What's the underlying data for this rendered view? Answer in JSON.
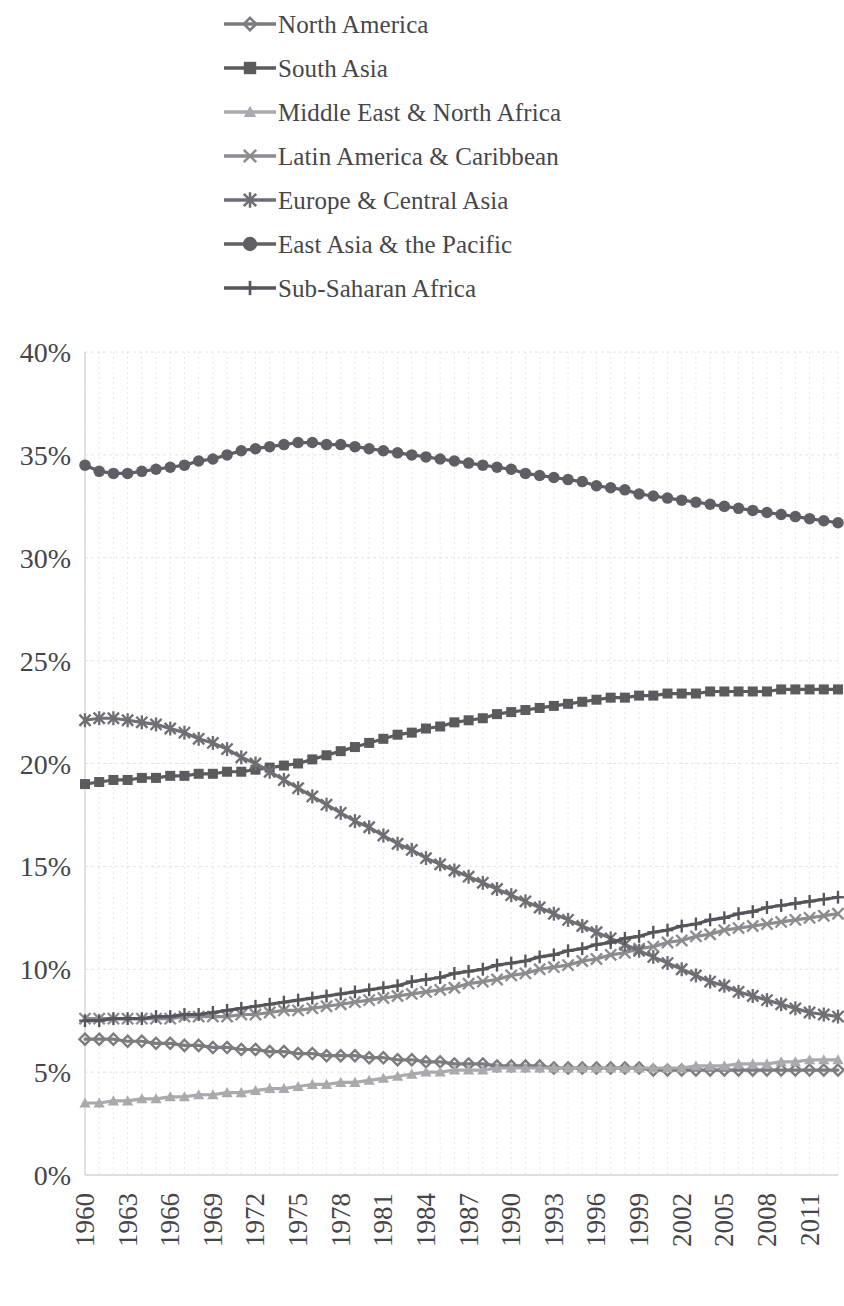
{
  "legend": {
    "position": "top",
    "items": [
      {
        "label": "North America",
        "marker": "diamond",
        "color": "#7b7b80"
      },
      {
        "label": "South Asia",
        "marker": "square",
        "color": "#5a5a5f"
      },
      {
        "label": "Middle East & North Africa",
        "marker": "triangle",
        "color": "#a9a9ae"
      },
      {
        "label": "Latin America & Caribbean",
        "marker": "x",
        "color": "#8b8b90"
      },
      {
        "label": "Europe & Central Asia",
        "marker": "asterisk",
        "color": "#6e6e74"
      },
      {
        "label": "East Asia & the Pacific",
        "marker": "circle",
        "color": "#5e5e64"
      },
      {
        "label": "Sub-Saharan Africa",
        "marker": "plus",
        "color": "#55555b"
      }
    ]
  },
  "axes": {
    "y_ticks": [
      "0%",
      "5%",
      "10%",
      "15%",
      "20%",
      "25%",
      "30%",
      "35%",
      "40%"
    ],
    "x_ticks": [
      "1960",
      "1963",
      "1966",
      "1969",
      "1972",
      "1975",
      "1978",
      "1981",
      "1984",
      "1987",
      "1990",
      "1993",
      "1996",
      "1999",
      "2002",
      "2005",
      "2008",
      "2011"
    ],
    "grid": "both-faint"
  },
  "chart_data": {
    "type": "line",
    "title": "",
    "subtitle": "",
    "xlabel": "",
    "ylabel": "",
    "ylim": [
      0,
      40
    ],
    "yunit": "%",
    "ytick_step": 5,
    "xlim": [
      1960,
      2013
    ],
    "xtick_step": 3,
    "grid": true,
    "legend_position": "top",
    "x": [
      1960,
      1961,
      1962,
      1963,
      1964,
      1965,
      1966,
      1967,
      1968,
      1969,
      1970,
      1971,
      1972,
      1973,
      1974,
      1975,
      1976,
      1977,
      1978,
      1979,
      1980,
      1981,
      1982,
      1983,
      1984,
      1985,
      1986,
      1987,
      1988,
      1989,
      1990,
      1991,
      1992,
      1993,
      1994,
      1995,
      1996,
      1997,
      1998,
      1999,
      2000,
      2001,
      2002,
      2003,
      2004,
      2005,
      2006,
      2007,
      2008,
      2009,
      2010,
      2011,
      2012,
      2013
    ],
    "series": [
      {
        "name": "North America",
        "marker": "diamond",
        "color": "#7b7b80",
        "values": [
          6.6,
          6.6,
          6.6,
          6.5,
          6.5,
          6.4,
          6.4,
          6.3,
          6.3,
          6.2,
          6.2,
          6.1,
          6.1,
          6.0,
          6.0,
          5.9,
          5.9,
          5.8,
          5.8,
          5.8,
          5.7,
          5.7,
          5.6,
          5.6,
          5.5,
          5.5,
          5.4,
          5.4,
          5.4,
          5.3,
          5.3,
          5.3,
          5.3,
          5.2,
          5.2,
          5.2,
          5.2,
          5.2,
          5.2,
          5.2,
          5.1,
          5.1,
          5.1,
          5.1,
          5.1,
          5.1,
          5.1,
          5.1,
          5.1,
          5.1,
          5.1,
          5.1,
          5.1,
          5.1
        ]
      },
      {
        "name": "South Asia",
        "marker": "square",
        "color": "#5a5a5f",
        "values": [
          19.0,
          19.1,
          19.2,
          19.2,
          19.3,
          19.3,
          19.4,
          19.4,
          19.5,
          19.5,
          19.6,
          19.6,
          19.7,
          19.8,
          19.9,
          20.0,
          20.2,
          20.4,
          20.6,
          20.8,
          21.0,
          21.2,
          21.4,
          21.5,
          21.7,
          21.8,
          22.0,
          22.1,
          22.2,
          22.4,
          22.5,
          22.6,
          22.7,
          22.8,
          22.9,
          23.0,
          23.1,
          23.2,
          23.2,
          23.3,
          23.3,
          23.4,
          23.4,
          23.4,
          23.5,
          23.5,
          23.5,
          23.5,
          23.5,
          23.6,
          23.6,
          23.6,
          23.6,
          23.6
        ]
      },
      {
        "name": "Middle East & North Africa",
        "marker": "triangle",
        "color": "#a9a9ae",
        "values": [
          3.5,
          3.5,
          3.6,
          3.6,
          3.7,
          3.7,
          3.8,
          3.8,
          3.9,
          3.9,
          4.0,
          4.0,
          4.1,
          4.2,
          4.2,
          4.3,
          4.4,
          4.4,
          4.5,
          4.5,
          4.6,
          4.7,
          4.8,
          4.9,
          5.0,
          5.0,
          5.1,
          5.1,
          5.1,
          5.2,
          5.2,
          5.2,
          5.2,
          5.2,
          5.2,
          5.2,
          5.2,
          5.2,
          5.2,
          5.2,
          5.2,
          5.2,
          5.2,
          5.3,
          5.3,
          5.3,
          5.4,
          5.4,
          5.4,
          5.5,
          5.5,
          5.6,
          5.6,
          5.6
        ]
      },
      {
        "name": "Latin America & Caribbean",
        "marker": "x",
        "color": "#8b8b90",
        "values": [
          7.6,
          7.6,
          7.6,
          7.6,
          7.6,
          7.6,
          7.6,
          7.7,
          7.7,
          7.7,
          7.7,
          7.8,
          7.8,
          7.9,
          8.0,
          8.0,
          8.1,
          8.2,
          8.3,
          8.4,
          8.5,
          8.6,
          8.7,
          8.8,
          8.9,
          9.0,
          9.1,
          9.3,
          9.4,
          9.5,
          9.7,
          9.8,
          10.0,
          10.1,
          10.2,
          10.4,
          10.5,
          10.7,
          10.8,
          11.0,
          11.1,
          11.3,
          11.4,
          11.6,
          11.7,
          11.9,
          12.0,
          12.1,
          12.2,
          12.3,
          12.4,
          12.5,
          12.6,
          12.7
        ]
      },
      {
        "name": "Europe & Central Asia",
        "marker": "asterisk",
        "color": "#6e6e74",
        "values": [
          22.1,
          22.2,
          22.2,
          22.1,
          22.0,
          21.9,
          21.7,
          21.5,
          21.2,
          21.0,
          20.7,
          20.3,
          20.0,
          19.6,
          19.2,
          18.8,
          18.4,
          18.0,
          17.6,
          17.2,
          16.9,
          16.5,
          16.1,
          15.8,
          15.4,
          15.1,
          14.8,
          14.5,
          14.2,
          13.9,
          13.6,
          13.3,
          13.0,
          12.7,
          12.4,
          12.1,
          11.8,
          11.5,
          11.2,
          10.9,
          10.6,
          10.3,
          10.0,
          9.7,
          9.4,
          9.2,
          8.9,
          8.7,
          8.5,
          8.3,
          8.1,
          7.9,
          7.8,
          7.7
        ]
      },
      {
        "name": "East Asia & the Pacific",
        "marker": "circle",
        "color": "#5e5e64",
        "values": [
          34.5,
          34.2,
          34.1,
          34.1,
          34.2,
          34.3,
          34.4,
          34.5,
          34.7,
          34.8,
          35.0,
          35.2,
          35.3,
          35.4,
          35.5,
          35.6,
          35.6,
          35.5,
          35.5,
          35.4,
          35.3,
          35.2,
          35.1,
          35.0,
          34.9,
          34.8,
          34.7,
          34.6,
          34.5,
          34.4,
          34.3,
          34.1,
          34.0,
          33.9,
          33.8,
          33.7,
          33.5,
          33.4,
          33.3,
          33.1,
          33.0,
          32.9,
          32.8,
          32.7,
          32.6,
          32.5,
          32.4,
          32.3,
          32.2,
          32.1,
          32.0,
          31.9,
          31.8,
          31.7
        ]
      },
      {
        "name": "Sub-Saharan Africa",
        "marker": "plus",
        "color": "#55555b",
        "values": [
          7.5,
          7.5,
          7.6,
          7.6,
          7.6,
          7.7,
          7.7,
          7.8,
          7.8,
          7.9,
          8.0,
          8.1,
          8.2,
          8.3,
          8.4,
          8.5,
          8.6,
          8.7,
          8.8,
          8.9,
          9.0,
          9.1,
          9.2,
          9.4,
          9.5,
          9.6,
          9.8,
          9.9,
          10.0,
          10.2,
          10.3,
          10.4,
          10.6,
          10.7,
          10.9,
          11.0,
          11.2,
          11.3,
          11.5,
          11.6,
          11.8,
          11.9,
          12.1,
          12.2,
          12.4,
          12.5,
          12.7,
          12.8,
          13.0,
          13.1,
          13.2,
          13.3,
          13.4,
          13.5
        ]
      }
    ]
  }
}
